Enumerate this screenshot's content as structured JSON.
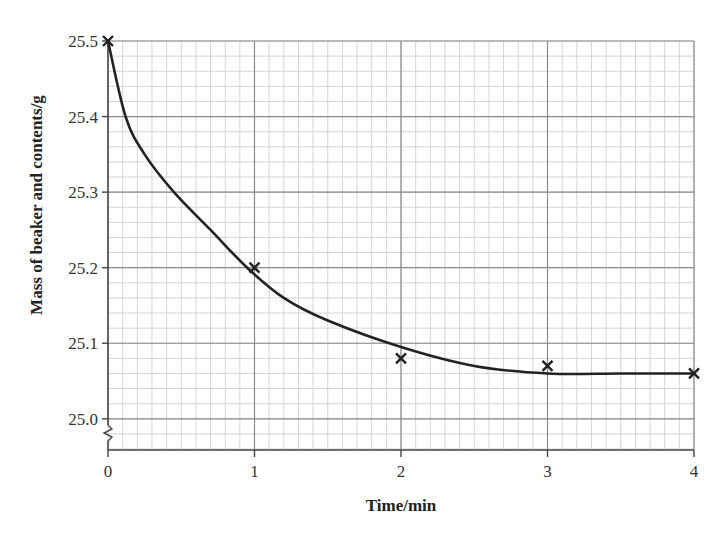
{
  "chart_data": {
    "type": "scatter",
    "title": "",
    "xlabel": "Time/min",
    "ylabel": "Mass of beaker and contents/g",
    "x_ticks": [
      "0",
      "1",
      "2",
      "3",
      "4"
    ],
    "y_ticks": [
      "25.0",
      "25.1",
      "25.2",
      "25.3",
      "25.4",
      "25.5"
    ],
    "xlim": [
      0,
      4
    ],
    "ylim": [
      24.96,
      25.5
    ],
    "y_axis_break": true,
    "grid": {
      "major": true,
      "minor": true,
      "x_minor_step": 0.1,
      "y_minor_step": 0.02
    },
    "legend": null,
    "series": [
      {
        "name": "measured",
        "marker": "x",
        "x": [
          0,
          1,
          2,
          3,
          4
        ],
        "y": [
          25.5,
          25.2,
          25.08,
          25.07,
          25.06
        ]
      },
      {
        "name": "best-fit curve",
        "style": "smooth line",
        "x": [
          0,
          0.12,
          0.25,
          0.45,
          0.7,
          0.95,
          1.2,
          1.5,
          2.0,
          2.5,
          3.0,
          3.5,
          4.0
        ],
        "y": [
          25.5,
          25.4,
          25.35,
          25.3,
          25.25,
          25.2,
          25.16,
          25.13,
          25.095,
          25.07,
          25.06,
          25.06,
          25.06
        ]
      }
    ]
  },
  "colors": {
    "minor_grid": "#d4d4d4",
    "major_grid": "#8a8a8a",
    "axis": "#444444",
    "curve": "#222222",
    "marker": "#222222"
  }
}
